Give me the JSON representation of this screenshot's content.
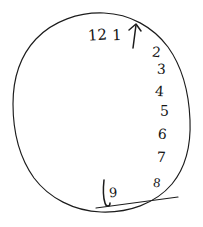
{
  "image": {
    "kind": "handwritten-clock-drawing",
    "description": "Hand-drawn clock face on plain white paper",
    "background_color": "#ffffff",
    "ink_color": "#1c1c1c",
    "width": 203,
    "height": 227
  },
  "clock": {
    "dial_label": "clock-face-outline",
    "numbers": [
      {
        "text": "12",
        "x": 88,
        "y": 28,
        "rotate": -4,
        "size": 15
      },
      {
        "text": "1",
        "x": 112,
        "y": 28,
        "rotate": -2,
        "size": 15
      },
      {
        "text": "2",
        "x": 152,
        "y": 45,
        "rotate": 6,
        "size": 14
      },
      {
        "text": "3",
        "x": 157,
        "y": 62,
        "rotate": 2,
        "size": 14
      },
      {
        "text": "4",
        "x": 155,
        "y": 84,
        "rotate": 4,
        "size": 14
      },
      {
        "text": "5",
        "x": 160,
        "y": 104,
        "rotate": 0,
        "size": 14
      },
      {
        "text": "6",
        "x": 158,
        "y": 127,
        "rotate": 5,
        "size": 14
      },
      {
        "text": "7",
        "x": 157,
        "y": 150,
        "rotate": 2,
        "size": 14
      },
      {
        "text": "8",
        "x": 153,
        "y": 177,
        "rotate": 8,
        "size": 12
      },
      {
        "text": "9",
        "x": 109,
        "y": 186,
        "rotate": -3,
        "size": 13
      }
    ],
    "hands": [
      {
        "name": "hand-pointing-to-one",
        "label": "upper hand with arrowhead near 1"
      },
      {
        "name": "hand-pointing-to-nine",
        "label": "lower vertical hand near 9"
      }
    ],
    "stray_marks": [
      {
        "name": "pen-overshoot-bottom-right",
        "label": "stray line crossing the rim at lower right"
      }
    ]
  }
}
